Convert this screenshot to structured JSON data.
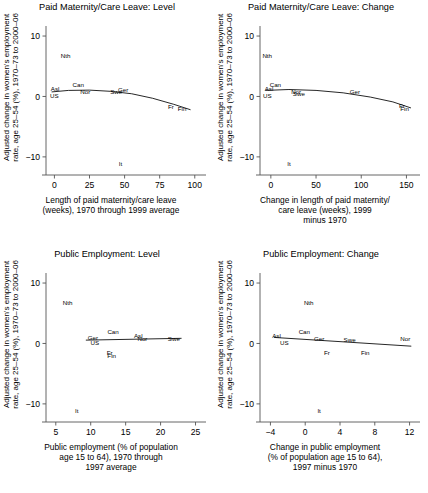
{
  "figure": {
    "ylabel": "Adjusted change in women's employment rate, age 25–54 (%), 1970–73 to 2000–06"
  },
  "chart_data": [
    {
      "type": "scatter",
      "panel": "p1",
      "title": "Paid Maternity/Care Leave: Level",
      "xlabel": "Length of paid maternity/care leave (weeks), 1970 through 1999 average",
      "xlabel_lines": [
        "Length of paid maternity/care leave",
        "(weeks), 1970 through 1999 average"
      ],
      "ylabel": "Adjusted change in women's employment rate, age 25–54 (%), 1970–73 to 2000–06",
      "xlim": [
        -6,
        108
      ],
      "ylim": [
        -13,
        11
      ],
      "xticks": [
        0,
        25,
        50,
        75,
        100
      ],
      "yticks": [
        10,
        0,
        -10
      ],
      "grid": false,
      "legend": "none",
      "points": [
        {
          "label": "Asl",
          "x": 0.5,
          "y": 1.2
        },
        {
          "label": "US",
          "x": 0.0,
          "y": 0.1
        },
        {
          "label": "Nth",
          "x": 8.0,
          "y": 6.8
        },
        {
          "label": "Can",
          "x": 17.0,
          "y": 1.9
        },
        {
          "label": "Nor",
          "x": 22.0,
          "y": 0.8
        },
        {
          "label": "Swe",
          "x": 44.0,
          "y": 0.7
        },
        {
          "label": "Ger",
          "x": 49.0,
          "y": 1.1
        },
        {
          "label": "It",
          "x": 47.0,
          "y": -11.2
        },
        {
          "label": "Fr",
          "x": 83.0,
          "y": -1.7
        },
        {
          "label": "Fin",
          "x": 91.0,
          "y": -2.0
        }
      ],
      "fit_curve": [
        {
          "x": -2,
          "y": 0.75
        },
        {
          "x": 10,
          "y": 1.0
        },
        {
          "x": 25,
          "y": 1.05
        },
        {
          "x": 40,
          "y": 0.85
        },
        {
          "x": 55,
          "y": 0.45
        },
        {
          "x": 70,
          "y": -0.3
        },
        {
          "x": 85,
          "y": -1.3
        },
        {
          "x": 97,
          "y": -2.2
        }
      ]
    },
    {
      "type": "scatter",
      "panel": "p2",
      "title": "Paid Maternity/Care Leave: Change",
      "xlabel": "Change in length of paid maternity/care leave (weeks), 1999 minus 1970",
      "xlabel_lines": [
        "Change in length of paid maternity/",
        "care leave (weeks), 1999",
        "minus 1970"
      ],
      "ylabel": "Adjusted change in women's employment rate, age 25–54 (%), 1970–73 to 2000–06",
      "xlim": [
        -12,
        165
      ],
      "ylim": [
        -13,
        11
      ],
      "xticks": [
        0,
        50,
        100,
        150
      ],
      "yticks": [
        10,
        0,
        -10
      ],
      "grid": false,
      "legend": "none",
      "points": [
        {
          "label": "Asl",
          "x": -2.0,
          "y": 1.2
        },
        {
          "label": "US",
          "x": -4.0,
          "y": 0.1
        },
        {
          "label": "Nth",
          "x": -4.0,
          "y": 6.8
        },
        {
          "label": "Can",
          "x": 5.0,
          "y": 1.9
        },
        {
          "label": "Nor",
          "x": 28.0,
          "y": 0.8
        },
        {
          "label": "Swe",
          "x": 31.0,
          "y": 0.5
        },
        {
          "label": "It",
          "x": 20.0,
          "y": -11.2
        },
        {
          "label": "Ger",
          "x": 93.0,
          "y": 0.8
        },
        {
          "label": "Fr",
          "x": 145.0,
          "y": -1.6
        },
        {
          "label": "Fin",
          "x": 148.0,
          "y": -2.0
        }
      ],
      "fit_curve": [
        {
          "x": -6,
          "y": 1.0
        },
        {
          "x": 20,
          "y": 1.15
        },
        {
          "x": 50,
          "y": 1.0
        },
        {
          "x": 80,
          "y": 0.6
        },
        {
          "x": 110,
          "y": -0.1
        },
        {
          "x": 135,
          "y": -0.9
        },
        {
          "x": 155,
          "y": -1.9
        }
      ]
    },
    {
      "type": "scatter",
      "panel": "p3",
      "title": "Public Employment: Level",
      "xlabel": "Public employment (% of population age 15 to 64), 1970 through 1997 average",
      "xlabel_lines": [
        "Public employment (% of population",
        "age 15 to 64), 1970 through",
        "1997 average"
      ],
      "ylabel": "Adjusted change in women's employment rate, age 25–54 (%), 1970–73 to 2000–06",
      "xlim": [
        3.6,
        26.5
      ],
      "ylim": [
        -13,
        11
      ],
      "xticks": [
        5,
        10,
        15,
        20,
        25
      ],
      "yticks": [
        10,
        0,
        -10
      ],
      "grid": false,
      "legend": "none",
      "points": [
        {
          "label": "Nth",
          "x": 6.7,
          "y": 6.8
        },
        {
          "label": "It",
          "x": 8.0,
          "y": -11.2
        },
        {
          "label": "Ger",
          "x": 10.3,
          "y": 0.9
        },
        {
          "label": "US",
          "x": 10.6,
          "y": 0.1
        },
        {
          "label": "Can",
          "x": 13.2,
          "y": 1.9
        },
        {
          "label": "Fr",
          "x": 12.7,
          "y": -1.6
        },
        {
          "label": "Fin",
          "x": 13.0,
          "y": -2.0
        },
        {
          "label": "Asl",
          "x": 16.8,
          "y": 1.2
        },
        {
          "label": "Nor",
          "x": 17.4,
          "y": 0.8
        },
        {
          "label": "Swe",
          "x": 21.9,
          "y": 0.7
        }
      ],
      "fit_line": [
        {
          "x": 9.3,
          "y": 0.55
        },
        {
          "x": 23.0,
          "y": 0.85
        }
      ]
    },
    {
      "type": "scatter",
      "panel": "p4",
      "title": "Public Employment: Change",
      "xlabel": "Change in public employment (% of population age 15 to 64), 1997 minus 1970",
      "xlabel_lines": [
        "Change in public employment",
        "(% of population age 15 to 64),",
        "1997 minus 1970"
      ],
      "ylabel": "Adjusted change in women's employment rate, age 25–54 (%), 1970–73 to 2000–06",
      "xlim": [
        -5.2,
        13.2
      ],
      "ylim": [
        -13,
        11
      ],
      "xticks": [
        -4,
        0,
        4,
        8,
        12
      ],
      "yticks": [
        10,
        0,
        -10
      ],
      "grid": false,
      "legend": "none",
      "points": [
        {
          "label": "Asl",
          "x": -3.3,
          "y": 1.2
        },
        {
          "label": "US",
          "x": -2.4,
          "y": 0.1
        },
        {
          "label": "Nth",
          "x": 0.4,
          "y": 6.8
        },
        {
          "label": "Can",
          "x": -0.1,
          "y": 1.9
        },
        {
          "label": "Ger",
          "x": 1.6,
          "y": 0.8
        },
        {
          "label": "It",
          "x": 1.6,
          "y": -11.2
        },
        {
          "label": "Fr",
          "x": 2.5,
          "y": -1.5
        },
        {
          "label": "Swe",
          "x": 5.1,
          "y": 0.6
        },
        {
          "label": "Fin",
          "x": 6.9,
          "y": -1.6
        },
        {
          "label": "Nor",
          "x": 11.5,
          "y": 0.8
        }
      ],
      "fit_line": [
        {
          "x": -3.6,
          "y": 1.0
        },
        {
          "x": 12.2,
          "y": -0.45
        }
      ]
    }
  ]
}
